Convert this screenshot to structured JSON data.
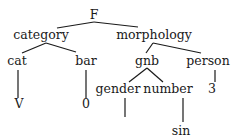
{
  "tree": {
    "nodes": [
      {
        "id": "F",
        "label": "F",
        "x": 94,
        "y": 15
      },
      {
        "id": "category",
        "label": "category",
        "x": 41,
        "y": 35
      },
      {
        "id": "morphology",
        "label": "morphology",
        "x": 154,
        "y": 35
      },
      {
        "id": "cat",
        "label": "cat",
        "x": 17,
        "y": 61
      },
      {
        "id": "bar",
        "label": "bar",
        "x": 86,
        "y": 61
      },
      {
        "id": "gnb",
        "label": "gnb",
        "x": 147,
        "y": 61
      },
      {
        "id": "person",
        "label": "person",
        "x": 208,
        "y": 61
      },
      {
        "id": "V",
        "label": "V",
        "x": 19,
        "y": 104
      },
      {
        "id": "zero",
        "label": "0",
        "x": 86,
        "y": 104
      },
      {
        "id": "gender",
        "label": "gender",
        "x": 118,
        "y": 89
      },
      {
        "id": "number",
        "label": "number",
        "x": 168,
        "y": 89
      },
      {
        "id": "three",
        "label": "3",
        "x": 212,
        "y": 89
      },
      {
        "id": "sin",
        "label": "sin",
        "x": 181,
        "y": 131
      }
    ],
    "edges": [
      {
        "x1": 57,
        "y1": 28,
        "x2": 94,
        "y2": 22
      },
      {
        "x1": 94,
        "y1": 22,
        "x2": 138,
        "y2": 27
      },
      {
        "x1": 46,
        "y1": 43,
        "x2": 22,
        "y2": 53
      },
      {
        "x1": 46,
        "y1": 43,
        "x2": 76,
        "y2": 52
      },
      {
        "x1": 153,
        "y1": 43,
        "x2": 146,
        "y2": 53
      },
      {
        "x1": 153,
        "y1": 43,
        "x2": 201,
        "y2": 53
      },
      {
        "x1": 18,
        "y1": 70,
        "x2": 18,
        "y2": 98
      },
      {
        "x1": 86,
        "y1": 70,
        "x2": 86,
        "y2": 98
      },
      {
        "x1": 147,
        "y1": 68,
        "x2": 129,
        "y2": 82
      },
      {
        "x1": 147,
        "y1": 68,
        "x2": 163,
        "y2": 82
      },
      {
        "x1": 215,
        "y1": 70,
        "x2": 215,
        "y2": 82
      },
      {
        "x1": 125,
        "y1": 98,
        "x2": 125,
        "y2": 117
      },
      {
        "x1": 183,
        "y1": 98,
        "x2": 183,
        "y2": 122
      }
    ]
  }
}
